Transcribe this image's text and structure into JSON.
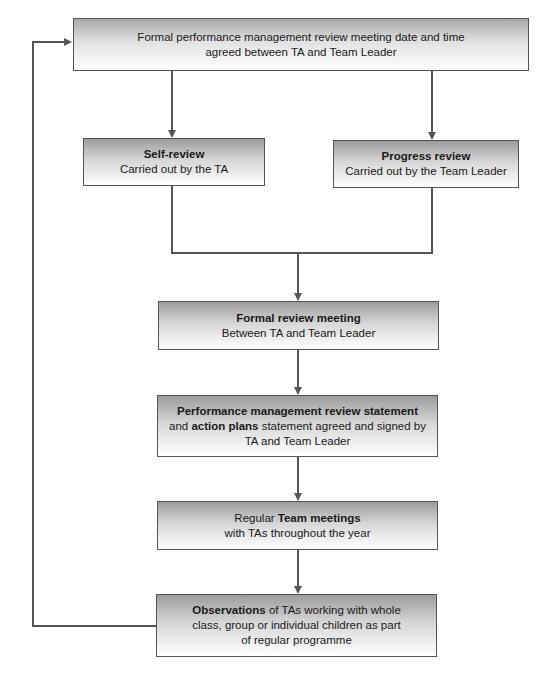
{
  "diagram": {
    "type": "flowchart",
    "nodes": {
      "start": {
        "line1": "Formal performance management review meeting date and time",
        "line2": "agreed between TA and Team Leader"
      },
      "self_review": {
        "title": "Self-review",
        "subtitle": "Carried out by the TA"
      },
      "progress_review": {
        "title": "Progress review",
        "subtitle": "Carried out by the Team Leader"
      },
      "formal_meeting": {
        "title": "Formal review meeting",
        "subtitle": "Between TA and Team Leader"
      },
      "statement": {
        "bold1": "Performance management review statement",
        "pre2": "and ",
        "bold2": "action plans",
        "post2": " statement agreed and signed by",
        "line3": "TA and Team Leader"
      },
      "team_meetings": {
        "pre": "Regular ",
        "bold": "Team meetings",
        "line2": "with TAs throughout the year"
      },
      "observations": {
        "bold": "Observations",
        "post1": " of TAs working with whole",
        "line2": "class, group or individual children as part",
        "line3": "of regular programme"
      }
    },
    "edges": [
      [
        "start",
        "self_review"
      ],
      [
        "start",
        "progress_review"
      ],
      [
        "self_review",
        "formal_meeting"
      ],
      [
        "progress_review",
        "formal_meeting"
      ],
      [
        "formal_meeting",
        "statement"
      ],
      [
        "statement",
        "team_meetings"
      ],
      [
        "team_meetings",
        "observations"
      ],
      [
        "observations",
        "start"
      ]
    ],
    "colors": {
      "border": "#555555",
      "gradient_top": "#9c9c9c",
      "gradient_bottom": "#ffffff"
    }
  }
}
